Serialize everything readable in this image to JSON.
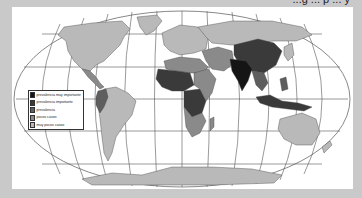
{
  "title": {
    "text": "...g ... p ... y",
    "note": "partially cut off above the frame"
  },
  "map": {
    "projection": "Robinson-like world map",
    "background_color": "#ffffff",
    "frame_color": "#c9c9c9",
    "graticule_color": "#555555"
  },
  "legend": {
    "items": [
      {
        "label": "prevalencia muy importante",
        "color": "#151515"
      },
      {
        "label": "prevalencia importante",
        "color": "#3a3a3a"
      },
      {
        "label": "prevalencia",
        "color": "#5e5e5e"
      },
      {
        "label": "pocos casos",
        "color": "#8a8a8a"
      },
      {
        "label": "muy pocos casos",
        "color": "#b9b9b9"
      }
    ]
  },
  "regions": [
    {
      "name": "North America",
      "category": "muy pocos casos"
    },
    {
      "name": "Greenland",
      "category": "muy pocos casos"
    },
    {
      "name": "Central America",
      "category": "pocos casos"
    },
    {
      "name": "South America (west/Andes)",
      "category": "prevalencia"
    },
    {
      "name": "South America (east)",
      "category": "muy pocos casos"
    },
    {
      "name": "Europe",
      "category": "muy pocos casos"
    },
    {
      "name": "Russia / Northern Asia",
      "category": "muy pocos casos"
    },
    {
      "name": "North Africa",
      "category": "pocos casos"
    },
    {
      "name": "West Africa",
      "category": "prevalencia importante"
    },
    {
      "name": "Central Africa",
      "category": "prevalencia importante"
    },
    {
      "name": "East Africa",
      "category": "pocos casos"
    },
    {
      "name": "Southern Africa",
      "category": "pocos casos"
    },
    {
      "name": "Middle East",
      "category": "pocos casos"
    },
    {
      "name": "India",
      "category": "prevalencia muy importante"
    },
    {
      "name": "China",
      "category": "prevalencia importante"
    },
    {
      "name": "Southeast Asia",
      "category": "prevalencia"
    },
    {
      "name": "Indonesia / New Guinea",
      "category": "prevalencia importante"
    },
    {
      "name": "Australia",
      "category": "muy pocos casos"
    },
    {
      "name": "New Zealand",
      "category": "muy pocos casos"
    },
    {
      "name": "Antarctica",
      "category": "muy pocos casos"
    }
  ]
}
